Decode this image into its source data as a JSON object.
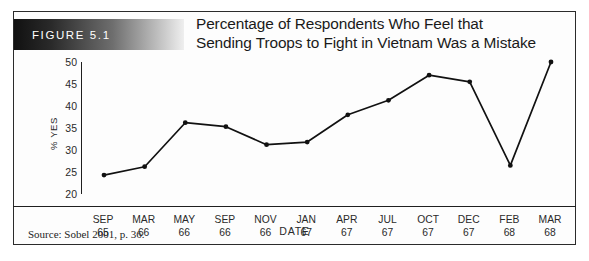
{
  "figure": {
    "banner_label": "FIGURE 5.1",
    "title_line_1": "Percentage of Respondents Who Feel that",
    "title_line_2": "Sending Troops to Fight in Vietnam Was a Mistake",
    "source_note": "Source: Sobel 2001, p. 36."
  },
  "chart_data": {
    "type": "line",
    "title": "Percentage of Respondents Who Feel that Sending Troops to Fight in Vietnam Was a Mistake",
    "xlabel": "DATE",
    "ylabel": "% YES",
    "categories": [
      "SEP 65",
      "MAR 66",
      "MAY 66",
      "SEP 66",
      "NOV 66",
      "JAN 67",
      "APR 67",
      "JUL 67",
      "OCT 67",
      "DEC 67",
      "FEB 68",
      "MAR 68"
    ],
    "category_months": [
      "SEP",
      "MAR",
      "MAY",
      "SEP",
      "NOV",
      "JAN",
      "APR",
      "JUL",
      "OCT",
      "DEC",
      "FEB",
      "MAR"
    ],
    "category_years": [
      "65",
      "66",
      "66",
      "66",
      "66",
      "67",
      "67",
      "67",
      "67",
      "67",
      "68",
      "68"
    ],
    "values": [
      24.3,
      26.2,
      36.2,
      35.3,
      31.2,
      31.8,
      38.0,
      41.3,
      47.0,
      45.5,
      26.5,
      50.0
    ],
    "ylim": [
      20,
      50
    ],
    "yticks": [
      20,
      25,
      30,
      35,
      40,
      45,
      50
    ],
    "grid": false,
    "legend": "none",
    "marker": "filled-circle",
    "line_color": "#111111",
    "marker_color": "#111111"
  }
}
